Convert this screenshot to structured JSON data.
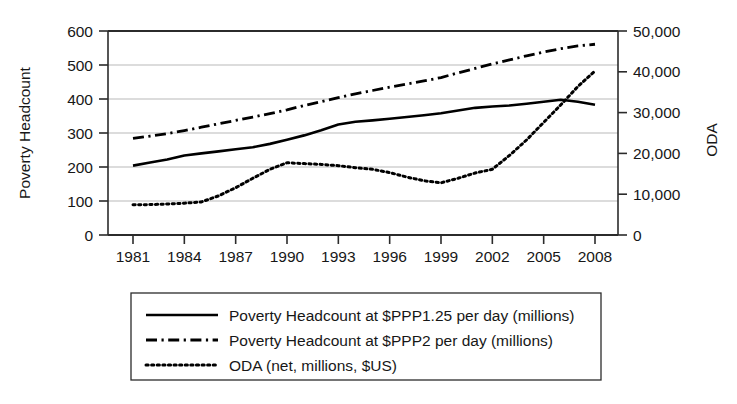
{
  "chart_data": {
    "type": "line",
    "title": "",
    "xlabel": "",
    "ylabel": "Poverty Headcount",
    "y2label": "ODA",
    "grid": true,
    "legend_position": "bottom",
    "x": [
      1981,
      1982,
      1983,
      1984,
      1985,
      1986,
      1987,
      1988,
      1989,
      1990,
      1991,
      1992,
      1993,
      1994,
      1995,
      1996,
      1997,
      1998,
      1999,
      2000,
      2001,
      2002,
      2003,
      2004,
      2005,
      2006,
      2007,
      2008
    ],
    "xtick_labels": [
      "1981",
      "1984",
      "1987",
      "1990",
      "1993",
      "1996",
      "1999",
      "2002",
      "2005",
      "2008"
    ],
    "xtick_values": [
      1981,
      1984,
      1987,
      1990,
      1993,
      1996,
      1999,
      2002,
      2005,
      2008
    ],
    "xlim": [
      1980,
      2009
    ],
    "ylim": [
      0,
      600
    ],
    "ytick_labels": [
      "0",
      "100",
      "200",
      "300",
      "400",
      "500",
      "600"
    ],
    "ytick_values": [
      0,
      100,
      200,
      300,
      400,
      500,
      600
    ],
    "y2lim": [
      0,
      50000
    ],
    "y2tick_labels": [
      "0",
      "10,000",
      "20,000",
      "30,000",
      "40,000",
      "50,000"
    ],
    "y2tick_values": [
      0,
      10000,
      20000,
      30000,
      40000,
      50000
    ],
    "series": [
      {
        "name": "Poverty Headcount at $PPP1.25 per day (millions)",
        "axis": "left",
        "style": "solid",
        "values": [
          204,
          213,
          222,
          234,
          240,
          246,
          252,
          258,
          268,
          280,
          293,
          308,
          325,
          333,
          337,
          342,
          347,
          352,
          358,
          366,
          374,
          378,
          381,
          386,
          392,
          398,
          392,
          383
        ]
      },
      {
        "name": "Poverty Headcount at $PPP2 per day (millions)",
        "axis": "left",
        "style": "dash-dot",
        "values": [
          284,
          291,
          298,
          307,
          317,
          327,
          337,
          347,
          357,
          368,
          381,
          392,
          404,
          415,
          425,
          435,
          444,
          453,
          463,
          477,
          490,
          503,
          515,
          527,
          538,
          548,
          556,
          561
        ]
      },
      {
        "name": "ODA (net, millions, $US)",
        "axis": "right",
        "style": "dotted",
        "values": [
          7400,
          7450,
          7600,
          7800,
          8100,
          9600,
          11600,
          13900,
          16100,
          17700,
          17500,
          17300,
          17000,
          16500,
          16100,
          15300,
          14200,
          13300,
          12800,
          13900,
          15200,
          16100,
          19500,
          23300,
          27600,
          31900,
          36400,
          40200
        ]
      }
    ]
  },
  "axes": {
    "left_title": "Poverty Headcount",
    "right_title": "ODA"
  },
  "legend": {
    "items": [
      {
        "label": "Poverty Headcount at $PPP1.25 per day (millions)",
        "style": "solid"
      },
      {
        "label": "Poverty Headcount at $PPP2 per day (millions)",
        "style": "dash-dot"
      },
      {
        "label": "ODA (net, millions, $US)",
        "style": "dotted"
      }
    ]
  },
  "colors": {
    "line": "#000000",
    "grid": "#b9b9b9",
    "axis": "#2b2b2b",
    "text": "#171717",
    "background": "#ffffff"
  }
}
